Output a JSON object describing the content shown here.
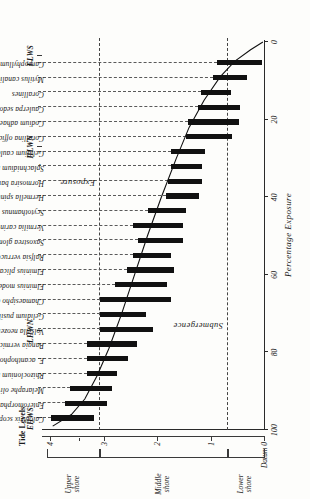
{
  "figure": {
    "x_axis_title": "Percentage Exposure",
    "x_ticks": [
      "100",
      "80",
      "60",
      "40",
      "20",
      "0"
    ],
    "y_ticks": [
      "Datum 0",
      "1",
      "2",
      "3",
      "4"
    ],
    "tide_header": "Tide Levels",
    "tide_levels": [
      "EHWS",
      "LHWN",
      "HLWN",
      "ELWS"
    ],
    "zones": [
      "Lower shore",
      "Middle shore",
      "Upper shore"
    ],
    "annotations": {
      "submergence": "Submergence",
      "exposure": "Exposure"
    }
  },
  "chart_data": {
    "type": "bar",
    "title": "",
    "xlabel": "Percentage Exposure",
    "ylabel": "Height above Datum (m)",
    "xlim": [
      100,
      0
    ],
    "ylim": [
      0,
      4
    ],
    "grid": false,
    "legend": "none",
    "orientation": "vertical-ranges",
    "note": "Each species is drawn as a vertical bar spanning its vertical range on the shore (metres above Datum). Species are ordered from highest on the shore (left) to lowest (right). A smooth curve shows percentage exposure versus shore height.",
    "categories": [
      "Calothrix scopulorum",
      "Enteromorpha intestinalis",
      "Melaraphe oliveri",
      "Rhizoclonium riparium",
      "E. acanthophora",
      "Bangia vermicularis",
      "Volsella neozelanicus",
      "Gelidium pusillum",
      "Chamaesipho columna",
      "Elminius modestus",
      "Elminius plicatus",
      "Ralfsia verrucosa",
      "Saxostrea glomerata",
      "Vermilia carinifera",
      "Scytothamnus australis",
      "Hermella spinulosa",
      "Hormosira banksii",
      "Splachnidium rugosum",
      "Gelidium caulacantheum",
      "Corallina officinalis",
      "Codium adhaerens",
      "Caulerpa sedoides",
      "Corallines",
      "Mytilus canaliculus",
      "Carpophyllum"
    ],
    "ranges_m_above_datum": [
      [
        3.18,
        3.98
      ],
      [
        2.93,
        3.72
      ],
      [
        2.85,
        3.63
      ],
      [
        2.74,
        3.3
      ],
      [
        2.55,
        3.3
      ],
      [
        2.37,
        3.3
      ],
      [
        2.08,
        3.06
      ],
      [
        2.2,
        3.06
      ],
      [
        1.73,
        3.06
      ],
      [
        1.82,
        2.78
      ],
      [
        1.69,
        2.56
      ],
      [
        1.73,
        2.45
      ],
      [
        1.52,
        2.35
      ],
      [
        1.52,
        2.45
      ],
      [
        1.46,
        2.17
      ],
      [
        1.22,
        1.84
      ],
      [
        1.15,
        1.79
      ],
      [
        1.15,
        1.74
      ],
      [
        1.11,
        1.74
      ],
      [
        0.6,
        1.46
      ],
      [
        0.47,
        1.42
      ],
      [
        0.44,
        1.24
      ],
      [
        0.62,
        1.18
      ],
      [
        0.32,
        0.95
      ],
      [
        0.04,
        0.88
      ]
    ],
    "exposure_curve": {
      "name": "Percentage exposure",
      "x_percent_exposure": [
        99,
        96,
        92,
        86,
        79,
        70,
        60,
        50,
        40,
        30,
        22,
        15,
        9,
        5,
        2,
        0
      ],
      "y_height_m": [
        3.95,
        3.6,
        3.35,
        3.12,
        2.9,
        2.66,
        2.42,
        2.18,
        1.92,
        1.64,
        1.4,
        1.12,
        0.82,
        0.55,
        0.25,
        0.02
      ]
    },
    "tide_levels_m": {
      "EHWS": 3.72,
      "LHWN": 2.78,
      "HLWN": 1.55,
      "ELWS": 0.4
    },
    "zone_boundaries_m": [
      0.7,
      3.08
    ]
  }
}
